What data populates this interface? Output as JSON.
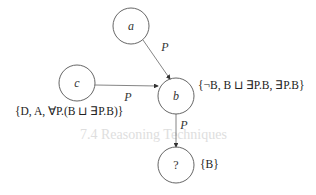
{
  "background_bleed": {
    "heading": "7.4 Reasoning Techniques",
    "lines": [
      "",
      ""
    ]
  },
  "diagram": {
    "nodes": [
      {
        "id": "a",
        "label": "a",
        "cx": 131,
        "cy": 26,
        "r": 18
      },
      {
        "id": "b",
        "label": "b",
        "cx": 176,
        "cy": 96,
        "r": 18
      },
      {
        "id": "c",
        "label": "c",
        "cx": 77,
        "cy": 83,
        "r": 18
      },
      {
        "id": "q",
        "label": "?",
        "cx": 176,
        "cy": 165,
        "r": 18
      }
    ],
    "edges": [
      {
        "from": "a",
        "to": "b",
        "label": "P"
      },
      {
        "from": "c",
        "to": "b",
        "label": "P"
      },
      {
        "from": "b",
        "to": "q",
        "label": "P"
      }
    ],
    "sets": {
      "b": "{¬B, B ⊔ ∃P.B, ∃P.B}",
      "c": "{D, A, ∀P.(B ⊔ ∃P.B)}",
      "q": "{B}"
    }
  }
}
